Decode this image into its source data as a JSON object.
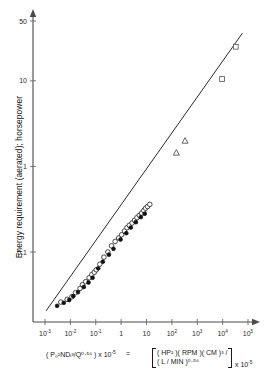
{
  "figure": {
    "width": 269,
    "height": 388,
    "background": "#ffffff",
    "line_color": "#2b2b2b",
    "axis_color": "#4a4a4a"
  },
  "axes": {
    "y_title": "Energy requirement (aerated); horsepower",
    "y_ticks": [
      {
        "label": "50",
        "value": 50
      },
      {
        "label": "10",
        "value": 10
      },
      {
        "label": "1",
        "value": 1
      },
      {
        "label": "0.1",
        "value": 0.1
      }
    ],
    "x_ticks": [
      {
        "mantissa": "10",
        "exponent": "-3",
        "value": 0.001
      },
      {
        "mantissa": "10",
        "exponent": "-2",
        "value": 0.01
      },
      {
        "mantissa": "10",
        "exponent": "-1",
        "value": 0.1
      },
      {
        "mantissa": "1",
        "exponent": "",
        "value": 1
      },
      {
        "mantissa": "10",
        "exponent": "",
        "value": 10
      },
      {
        "mantissa": "10",
        "exponent": "2",
        "value": 100
      },
      {
        "mantissa": "10",
        "exponent": "3",
        "value": 1000
      },
      {
        "mantissa": "10",
        "exponent": "4",
        "value": 10000
      },
      {
        "mantissa": "10",
        "exponent": "5",
        "value": 100000
      }
    ],
    "x_label_left": "( P₀²NDᵢ³/Q⁰·⁵⁶ ) x 10",
    "x_label_left_exp": "-5",
    "x_label_equals": "=",
    "x_label_bracket_line1": "( HP² )( RPM )( CM )³ /",
    "x_label_bracket_line2": "( L / MIN )⁰·⁵⁶",
    "x_label_tail": "x 10",
    "x_label_tail_exp": "-5"
  },
  "chart_data": {
    "type": "scatter",
    "title": "",
    "xlabel": "( Po2 N Di3 / Q0.56 ) x 10-5 = [ (HP2)(RPM)(CM)3 / (L/MIN)0.56 ] x 10-5",
    "ylabel": "Energy requirement (aerated); horsepower",
    "xscale": "log",
    "yscale": "log",
    "xlim": [
      0.001,
      100000
    ],
    "ylim": [
      0.018,
      55
    ],
    "grid": false,
    "legend": "none",
    "fit_line": {
      "name": "correlation line",
      "x": [
        0.0011,
        60000
      ],
      "y": [
        0.0205,
        36.0
      ],
      "slope_loglog": 0.94
    },
    "series": [
      {
        "name": "open circles",
        "marker": "circle-open",
        "x": [
          0.0042,
          0.0075,
          0.0115,
          0.016,
          0.024,
          0.03,
          0.04,
          0.055,
          0.07,
          0.088,
          0.105,
          0.145,
          0.21,
          0.3,
          0.42,
          0.58,
          0.8,
          1.05,
          1.35,
          1.7,
          2.1,
          2.7,
          3.4,
          4.2,
          5.2,
          6.4,
          7.8,
          9.2,
          11.0,
          13.5
        ],
        "y": [
          0.026,
          0.028,
          0.03,
          0.0335,
          0.0375,
          0.0415,
          0.045,
          0.05,
          0.0545,
          0.058,
          0.062,
          0.072,
          0.087,
          0.1,
          0.118,
          0.133,
          0.146,
          0.159,
          0.176,
          0.192,
          0.205,
          0.218,
          0.235,
          0.252,
          0.268,
          0.285,
          0.305,
          0.325,
          0.34,
          0.36
        ]
      },
      {
        "name": "filled circles",
        "marker": "circle-filled",
        "x": [
          0.003,
          0.0055,
          0.009,
          0.013,
          0.02,
          0.034,
          0.052,
          0.075,
          0.125,
          0.19,
          0.33,
          0.5,
          0.95,
          1.6,
          2.4,
          3.8,
          6.0,
          8.5
        ],
        "y": [
          0.0235,
          0.0255,
          0.0275,
          0.0305,
          0.034,
          0.039,
          0.044,
          0.05,
          0.0645,
          0.077,
          0.093,
          0.109,
          0.14,
          0.166,
          0.193,
          0.223,
          0.256,
          0.28
        ]
      },
      {
        "name": "open triangles",
        "marker": "triangle-open",
        "x": [
          150,
          330
        ],
        "y": [
          1.45,
          2.0
        ]
      },
      {
        "name": "open squares",
        "marker": "square-open",
        "x": [
          9500,
          33000
        ],
        "y": [
          10.5,
          25.0
        ]
      }
    ]
  }
}
